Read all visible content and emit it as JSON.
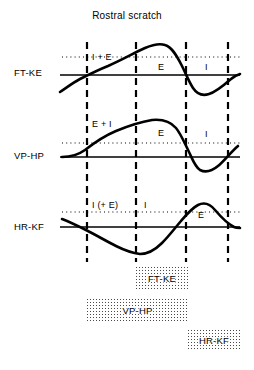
{
  "figure": {
    "title": "Rostral scratch",
    "width": 254,
    "height": 370,
    "background": "#ffffff",
    "ink_color": "#000000",
    "stipple_color": "#4a4a4a"
  },
  "phase_boundaries": {
    "label": "vertical dashed phase-boundary lines",
    "x_positions": [
      87,
      136,
      186,
      228
    ],
    "top": 42,
    "bottom": 262,
    "style": "dashed"
  },
  "traces": [
    {
      "id": "ft-ke",
      "label": "FT-KE",
      "label_x": 14,
      "label_y": 67,
      "baseline_y": 75,
      "baseline_x_start": 60,
      "baseline_x_end": 240,
      "dotted_reference_y": 57,
      "dotted_x_start": 62,
      "dotted_x_end": 240,
      "annotations": [
        {
          "text": "I + E",
          "x": 92,
          "y": 52
        },
        {
          "text": "E",
          "x": 158,
          "y": 62
        },
        {
          "text": "I",
          "x": 205,
          "y": 62
        }
      ],
      "waveform": "M60,92 C66,88 74,82 80,79 C88,75 98,70 108,66 C122,60 134,53 145,48 C152,45 159,43 165,45 C172,47 177,56 182,66 C186,74 189,82 193,88 C197,94 203,96 209,94 C216,92 223,86 231,79 C234,76 237,75 240,74"
    },
    {
      "id": "vp-hp",
      "label": "VP-HP",
      "label_x": 14,
      "label_y": 150,
      "baseline_y": 157,
      "baseline_x_start": 60,
      "baseline_x_end": 240,
      "dotted_reference_y": 143,
      "dotted_x_start": 62,
      "dotted_x_end": 240,
      "annotations": [
        {
          "text": "E + I",
          "x": 92,
          "y": 119
        },
        {
          "text": "E",
          "x": 158,
          "y": 128
        },
        {
          "text": "I",
          "x": 205,
          "y": 129
        }
      ],
      "waveform": "M62,157 C70,157 78,155 85,150 C94,143 104,136 116,131 C128,126 140,122 152,120 C162,119 170,121 176,128 C181,134 185,144 189,152 C192,158 195,167 200,170 C206,173 212,171 218,166 C224,161 231,152 238,146"
    },
    {
      "id": "hr-kf",
      "label": "HR-KF",
      "label_x": 14,
      "label_y": 221,
      "baseline_y": 227,
      "baseline_x_start": 60,
      "baseline_x_end": 240,
      "dotted_reference_y": 212,
      "dotted_x_start": 62,
      "dotted_x_end": 240,
      "annotations": [
        {
          "text": "I (+ E)",
          "x": 92,
          "y": 200
        },
        {
          "text": "I",
          "x": 144,
          "y": 200
        },
        {
          "text": "E",
          "x": 198,
          "y": 210
        }
      ],
      "waveform": "M62,219 C70,222 78,226 86,230 C96,235 106,241 116,246 C124,250 132,253 140,254 C148,254 155,250 162,243 C169,236 175,228 181,221 C187,214 192,208 198,205 C204,202 210,204 215,210 C221,217 228,224 234,227 C236,228 238,228 240,228"
    }
  ],
  "phase_bars": [
    {
      "id": "bar-ft-ke",
      "label": "FT-KE",
      "x": 136,
      "y": 267,
      "width": 52,
      "height": 22
    },
    {
      "id": "bar-vp-hp",
      "label": "VP-HP",
      "x": 87,
      "y": 299,
      "width": 101,
      "height": 22
    },
    {
      "id": "bar-hr-kf",
      "label": "HR-KF",
      "x": 188,
      "y": 330,
      "width": 52,
      "height": 21
    }
  ],
  "legend_key": {
    "E": "excitation",
    "I": "inhibition"
  }
}
